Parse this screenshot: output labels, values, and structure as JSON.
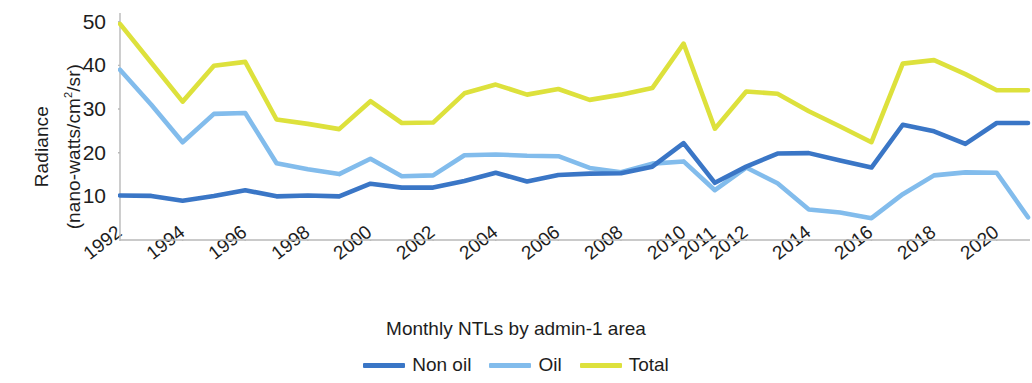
{
  "chart_data": {
    "type": "line",
    "title": "",
    "caption": "Monthly NTLs by admin-1 area",
    "ylabel_line1": "Radiance",
    "ylabel_line2": "(nano-watts/cm2/sr)",
    "ylabel_line2_base": "(nano-watts/cm",
    "ylabel_line2_sup": "2",
    "ylabel_line2_tail": "/sr)",
    "xlabel": "",
    "grid": false,
    "legend_position": "bottom-center",
    "ylim": [
      0,
      52
    ],
    "yticks": [
      10,
      20,
      30,
      40,
      50
    ],
    "x": [
      1992,
      1993,
      1994,
      1995,
      1996,
      1997,
      1998,
      1999,
      2000,
      2001,
      2002,
      2003,
      2004,
      2005,
      2006,
      2007,
      2008,
      2009,
      2010,
      2011,
      2011.5,
      2012,
      2013,
      2014,
      2015,
      2016,
      2017,
      2018,
      2019,
      2020
    ],
    "xtick_labels": [
      "1992",
      "1994",
      "1996",
      "1998",
      "2000",
      "2002",
      "2004",
      "2006",
      "2008",
      "2010",
      "2011",
      "2012",
      "2014",
      "2016",
      "2018",
      "2020"
    ],
    "xtick_values": [
      1992,
      1994,
      1996,
      1998,
      2000,
      2002,
      2004,
      2006,
      2008,
      2010,
      2011,
      2011.5,
      2013,
      2015,
      2017,
      2019
    ],
    "series": [
      {
        "name": "Non oil",
        "color": "#3a76c6",
        "values": [
          10.2,
          10.1,
          9.0,
          10.1,
          11.4,
          10.0,
          10.2,
          10.0,
          12.9,
          12.0,
          12.0,
          13.5,
          15.4,
          13.4,
          14.9,
          15.2,
          15.3,
          16.8,
          22.2,
          13.1,
          16.8,
          19.8,
          19.9,
          18.2,
          16.6,
          26.4,
          24.9,
          22.0,
          26.8,
          26.8
        ]
      },
      {
        "name": "Oil",
        "color": "#82bcec",
        "values": [
          39.0,
          31.0,
          22.4,
          28.9,
          29.1,
          17.6,
          16.2,
          15.1,
          18.6,
          14.6,
          14.8,
          19.4,
          19.6,
          19.3,
          19.2,
          16.5,
          15.5,
          17.5,
          18.0,
          11.4,
          16.6,
          13.0,
          7.0,
          6.3,
          5.0,
          10.5,
          14.8,
          15.5,
          15.4,
          5.2
        ]
      },
      {
        "name": "Total",
        "color": "#dde13c",
        "values": [
          49.5,
          40.6,
          31.7,
          39.9,
          40.8,
          27.6,
          26.6,
          25.4,
          31.8,
          26.8,
          26.9,
          33.6,
          35.6,
          33.3,
          34.6,
          32.1,
          33.3,
          34.8,
          45.0,
          25.5,
          34.0,
          33.5,
          29.5,
          26.0,
          22.4,
          40.4,
          41.2,
          38.0,
          34.3,
          34.3
        ]
      }
    ]
  },
  "legend": {
    "items": [
      {
        "label": "Non oil",
        "color": "#3a76c6"
      },
      {
        "label": "Oil",
        "color": "#82bcec"
      },
      {
        "label": "Total",
        "color": "#dde13c"
      }
    ]
  }
}
